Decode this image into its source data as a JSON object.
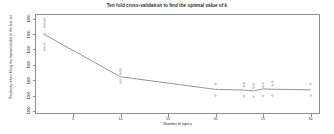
{
  "chart_data": {
    "type": "line",
    "title": "Ten fold cross-validation to find the optimal value of k",
    "xlabel": "Number of topics",
    "ylabel": "Perplexity when fitting the trained model to the test set",
    "grid": false,
    "legend": "none",
    "xlim": [
      1,
      31
    ],
    "ylim": [
      1180,
      1830
    ],
    "xticks": [
      5,
      10,
      15,
      20,
      25,
      30
    ],
    "yticks": [
      1200,
      1300,
      1400,
      1500,
      1600,
      1700,
      1800
    ],
    "series": [
      {
        "name": "mean perplexity",
        "x": [
          2,
          10,
          20,
          23,
          24,
          25,
          26,
          30
        ],
        "values": [
          1696,
          1422,
          1340,
          1336,
          1330,
          1343,
          1341,
          1337
        ]
      }
    ],
    "scatter": {
      "name": "per-fold perplexity",
      "points": [
        {
          "x": 2,
          "y": 1800
        },
        {
          "x": 2,
          "y": 1784
        },
        {
          "x": 2,
          "y": 1766
        },
        {
          "x": 2,
          "y": 1748
        },
        {
          "x": 2,
          "y": 1700
        },
        {
          "x": 2,
          "y": 1634
        },
        {
          "x": 2,
          "y": 1612
        },
        {
          "x": 2,
          "y": 1596
        },
        {
          "x": 10,
          "y": 1470
        },
        {
          "x": 10,
          "y": 1455
        },
        {
          "x": 10,
          "y": 1440
        },
        {
          "x": 10,
          "y": 1400
        },
        {
          "x": 10,
          "y": 1384
        },
        {
          "x": 20,
          "y": 1376
        },
        {
          "x": 20,
          "y": 1300
        },
        {
          "x": 23,
          "y": 1380
        },
        {
          "x": 23,
          "y": 1360
        },
        {
          "x": 23,
          "y": 1296
        },
        {
          "x": 24,
          "y": 1372
        },
        {
          "x": 24,
          "y": 1352
        },
        {
          "x": 24,
          "y": 1292
        },
        {
          "x": 25,
          "y": 1378
        },
        {
          "x": 25,
          "y": 1358
        },
        {
          "x": 25,
          "y": 1298
        },
        {
          "x": 26,
          "y": 1390
        },
        {
          "x": 26,
          "y": 1366
        },
        {
          "x": 26,
          "y": 1300
        },
        {
          "x": 30,
          "y": 1374
        },
        {
          "x": 30,
          "y": 1300
        }
      ]
    },
    "colors": {
      "line": "#7a7a7a",
      "point": "#9a9a9a",
      "frame": "#8d8d8d",
      "text": "#2b2b2b",
      "background": "#ffffff"
    }
  }
}
